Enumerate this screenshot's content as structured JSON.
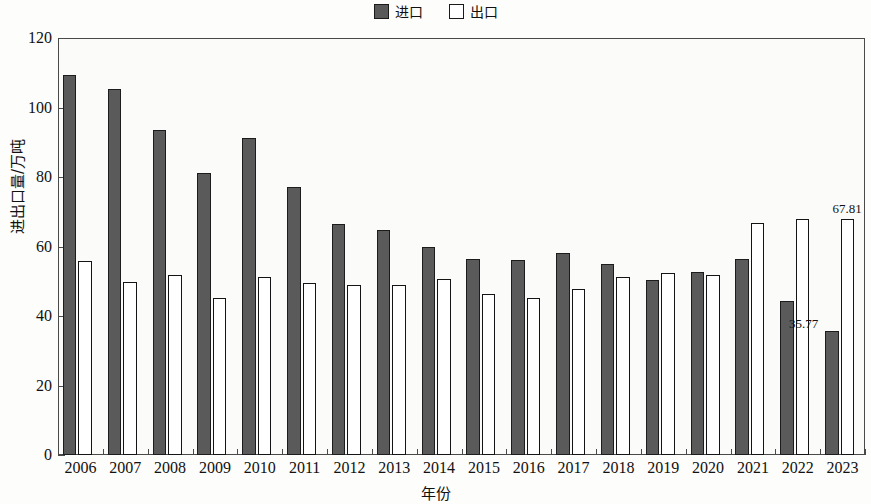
{
  "chart_data": {
    "type": "bar",
    "title": "",
    "xlabel": "年份",
    "ylabel": "进出口量/万吨",
    "categories": [
      "2006",
      "2007",
      "2008",
      "2009",
      "2010",
      "2011",
      "2012",
      "2013",
      "2014",
      "2015",
      "2016",
      "2017",
      "2018",
      "2019",
      "2020",
      "2021",
      "2022",
      "2023"
    ],
    "ylim": [
      0,
      120
    ],
    "y_ticks": [
      0,
      20,
      40,
      60,
      80,
      100,
      120
    ],
    "grid": false,
    "legend_position": "top-center",
    "series": [
      {
        "name": "进口",
        "style": "filled",
        "color": "#5a5a5a",
        "values": [
          109.3,
          105.3,
          93.4,
          81.2,
          91.2,
          77.0,
          66.4,
          64.7,
          59.8,
          56.3,
          56.0,
          58.2,
          55.1,
          50.4,
          52.7,
          56.3,
          44.3,
          35.77
        ]
      },
      {
        "name": "出口",
        "style": "hollow",
        "color": "#ffffff",
        "values": [
          55.8,
          49.7,
          51.7,
          45.2,
          51.3,
          49.5,
          49.0,
          48.8,
          50.6,
          46.3,
          45.2,
          47.7,
          51.1,
          52.4,
          51.9,
          66.8,
          67.8,
          67.81
        ]
      }
    ],
    "annotations": [
      {
        "text": "35.77",
        "series": "进口",
        "category": "2023"
      },
      {
        "text": "67.81",
        "series": "出口",
        "category": "2023"
      }
    ]
  },
  "legend": {
    "entries": [
      {
        "label": "进口",
        "swatch": "filled-square-icon"
      },
      {
        "label": "出口",
        "swatch": "hollow-square-icon"
      }
    ]
  },
  "axes": {
    "y_title": "进出口量/万吨",
    "x_title": "年份",
    "y_tick_labels": [
      "0",
      "20",
      "40",
      "60",
      "80",
      "100",
      "120"
    ],
    "x_tick_labels": [
      "2006",
      "2007",
      "2008",
      "2009",
      "2010",
      "2011",
      "2012",
      "2013",
      "2014",
      "2015",
      "2016",
      "2017",
      "2018",
      "2019",
      "2020",
      "2021",
      "2022",
      "2023"
    ]
  }
}
